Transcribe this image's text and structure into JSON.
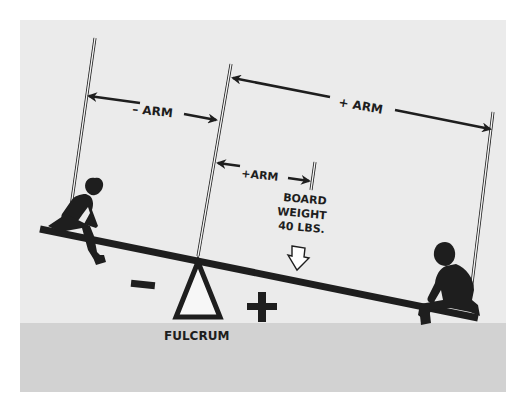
{
  "diagram": {
    "labels": {
      "minus_arm": "– ARM",
      "plus_arm_long": "+ ARM",
      "plus_arm_short": "+ARM",
      "board_weight_line1": "BOARD",
      "board_weight_line2": "WEIGHT",
      "board_weight_line3": "40 LBS.",
      "fulcrum": "FULCRUM",
      "minus_sign": "–",
      "plus_sign": "+"
    },
    "colors": {
      "background": "#ebebeb",
      "ground": "#d2d2d2",
      "ink": "#1e1e1e",
      "page": "#ffffff"
    }
  }
}
